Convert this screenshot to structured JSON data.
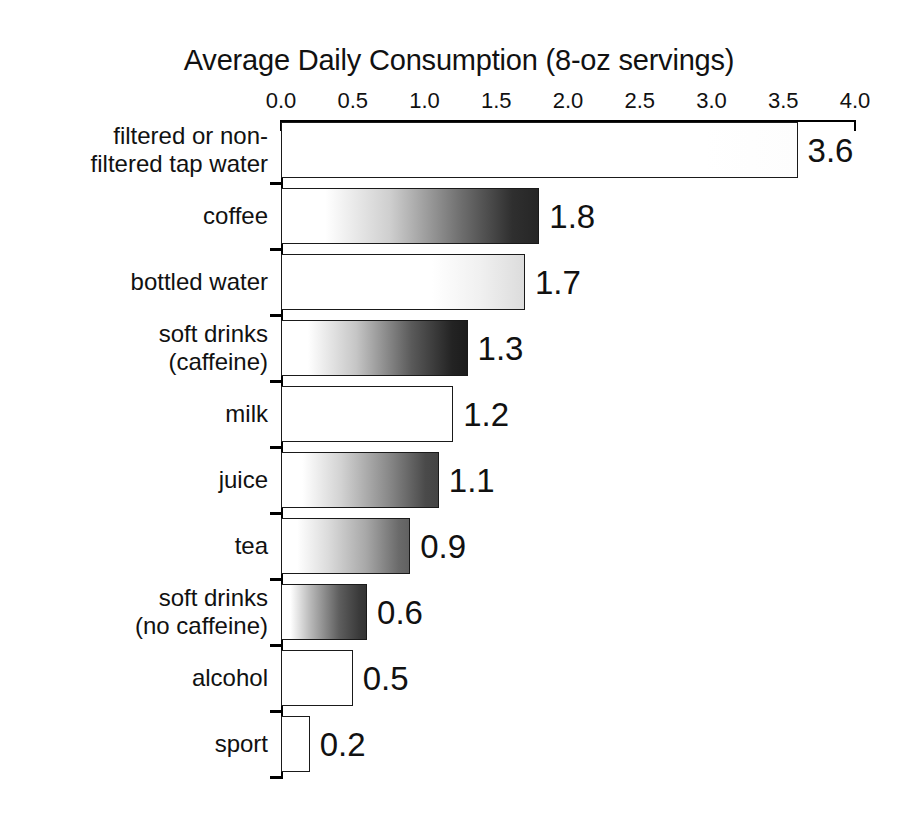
{
  "chart_data": {
    "type": "bar",
    "orientation": "horizontal",
    "title": "Average Daily Consumption (8-oz servings)",
    "xlabel": "Average Daily Consumption (8-oz servings)",
    "ylabel": "",
    "xlim": [
      0.0,
      4.0
    ],
    "grid": false,
    "legend": "none",
    "axis_position": "top",
    "xticks": [
      "0.0",
      "0.5",
      "1.0",
      "1.5",
      "2.0",
      "2.5",
      "3.0",
      "3.5",
      "4.0"
    ],
    "xtick_values": [
      0.0,
      0.5,
      1.0,
      1.5,
      2.0,
      2.5,
      3.0,
      3.5,
      4.0
    ],
    "categories": [
      "filtered or non-\nfiltered tap water",
      "coffee",
      "bottled water",
      "soft drinks\n(caffeine)",
      "milk",
      "juice",
      "tea",
      "soft drinks\n(no caffeine)",
      "alcohol",
      "sport"
    ],
    "values": [
      3.6,
      1.8,
      1.7,
      1.3,
      1.2,
      1.1,
      0.9,
      0.6,
      0.5,
      0.2
    ],
    "value_labels": [
      "3.6",
      "1.8",
      "1.7",
      "1.3",
      "1.2",
      "1.1",
      "0.9",
      "0.6",
      "0.5",
      "0.2"
    ],
    "bar_fills": [
      "linear-gradient(to right, #ffffff 0%, #ffffff 82%, #fdfdfd 100%)",
      "linear-gradient(to right, #ffffff 0%, #ffffff 17%, #cfcfcf 42%, #6e6e6e 70%, #2f2f2f 90%, #262626 100%)",
      "linear-gradient(to right, #ffffff 0%, #ffffff 62%, #f0f0f0 82%, #dcdcdc 100%)",
      "linear-gradient(to right, #ffffff 0%, #ffffff 14%, #c6c6c6 40%, #5a5a5a 70%, #232323 92%, #1c1c1c 100%)",
      "linear-gradient(to right, #ffffff 0%, #ffffff 100%)",
      "linear-gradient(to right, #ffffff 0%, #ffffff 13%, #d2d2d2 38%, #8a8a8a 68%, #4a4a4a 92%, #444444 100%)",
      "linear-gradient(to right, #ffffff 0%, #ffffff 12%, #dcdcdc 36%, #a8a8a8 66%, #6a6a6a 92%, #616161 100%)",
      "linear-gradient(to right, #ffffff 0%, #ffffff 10%, #b8b8b8 34%, #5e5e5e 68%, #3a3a3a 92%, #343434 100%)",
      "linear-gradient(to right, #ffffff 0%, #ffffff 100%)",
      "linear-gradient(to right, #ffffff 0%, #ffffff 100%)"
    ]
  }
}
